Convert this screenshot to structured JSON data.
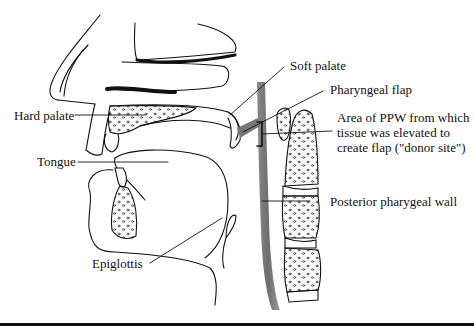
{
  "diagram": {
    "type": "anatomical-sagittal-section",
    "labels": {
      "soft_palate": "Soft palate",
      "pharyngeal_flap": "Pharyngeal flap",
      "donor_site": "Area of PPW from which tissue was elevated to create flap (\"donor site\")",
      "hard_palate": "Hard palate",
      "tongue": "Tongue",
      "posterior_wall": "Posterior pharygeal wall",
      "epiglottis": "Epiglottis"
    },
    "colors": {
      "ink": "#111111",
      "background": "#ffffff",
      "wall_shading": "#7a7a7a"
    }
  }
}
